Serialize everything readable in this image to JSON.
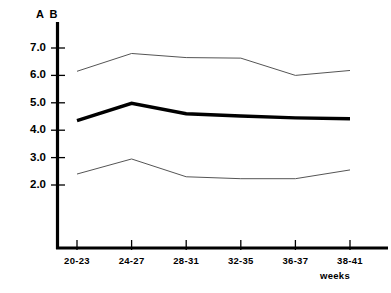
{
  "chart_data": {
    "type": "line",
    "title": "",
    "ylabel": "A B",
    "xlabel": "weeks",
    "categories": [
      "20-23",
      "24-27",
      "28-31",
      "32-35",
      "36-37",
      "38-41"
    ],
    "yticks": [
      "7.0",
      "6.0",
      "5.0",
      "4.0",
      "3.0",
      "2.0"
    ],
    "ytick_values": [
      7.0,
      6.0,
      5.0,
      4.0,
      3.0,
      2.0
    ],
    "ylim": [
      0.0,
      7.6
    ],
    "grid": false,
    "legend": "none",
    "series": [
      {
        "name": "upper-limit",
        "style": "thin",
        "color": "#555555",
        "values": [
          6.15,
          6.8,
          6.65,
          6.63,
          6.0,
          6.18
        ]
      },
      {
        "name": "mean",
        "style": "thick",
        "color": "#000000",
        "values": [
          4.35,
          4.98,
          4.6,
          4.52,
          4.45,
          4.42
        ]
      },
      {
        "name": "lower-limit",
        "style": "thin",
        "color": "#555555",
        "values": [
          2.4,
          2.95,
          2.3,
          2.23,
          2.23,
          2.55
        ]
      }
    ]
  }
}
